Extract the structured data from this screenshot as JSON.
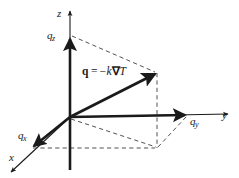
{
  "figure": {
    "colors": {
      "stroke": "#1a1a1a",
      "background": "#ffffff",
      "dashed": "#4a4a4a"
    }
  },
  "axes": [
    {
      "id": "z",
      "label": "z",
      "direction": "up",
      "name": "z-axis"
    },
    {
      "id": "y",
      "label": "y",
      "direction": "right",
      "name": "y-axis"
    },
    {
      "id": "x",
      "label": "x",
      "direction": "down-left",
      "name": "x-axis"
    }
  ],
  "components": [
    {
      "id": "qz",
      "symbol": "q",
      "subscript": "z",
      "name": "heat-flux-z-component"
    },
    {
      "id": "qy",
      "symbol": "q",
      "subscript": "y",
      "name": "heat-flux-y-component"
    },
    {
      "id": "qx",
      "symbol": "q",
      "subscript": "x",
      "name": "heat-flux-x-component"
    }
  ],
  "equation": {
    "vector": "q",
    "equals": "=",
    "minus": "−",
    "conductivity": "k",
    "nabla": "∇",
    "temperature": "T",
    "full_text": "q = −k∇T"
  }
}
